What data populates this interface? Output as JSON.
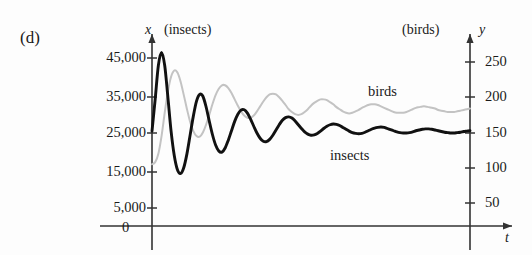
{
  "panel": {
    "label": "(d)"
  },
  "axes": {
    "left": {
      "variable": "x",
      "unit_label": "(insects)",
      "ticks": [
        {
          "label": "45,000",
          "value": 45000,
          "py": 58
        },
        {
          "label": "35,000",
          "value": 35000,
          "py": 97
        },
        {
          "label": "25,000",
          "value": 25000,
          "py": 133
        },
        {
          "label": "15,000",
          "value": 15000,
          "py": 172
        },
        {
          "label": "5,000",
          "value": 5000,
          "py": 208
        }
      ]
    },
    "right": {
      "variable": "y",
      "unit_label": "(birds)",
      "ticks": [
        {
          "label": "250",
          "value": 250,
          "py": 62
        },
        {
          "label": "200",
          "value": 200,
          "py": 97
        },
        {
          "label": "150",
          "value": 150,
          "py": 133
        },
        {
          "label": "100",
          "value": 100,
          "py": 168
        },
        {
          "label": "50",
          "value": 50,
          "py": 203
        }
      ]
    },
    "bottom": {
      "variable": "t",
      "origin_label": "0"
    }
  },
  "series_labels": {
    "birds": "birds",
    "insects": "insects"
  },
  "colors": {
    "insects": "#111111",
    "birds": "#c3c3c3",
    "axis": "#333333",
    "text": "#1a1a1a",
    "background": "#fdfdfd"
  },
  "chart_data": {
    "type": "line",
    "title": "",
    "xlabel": "t",
    "ylabel": "x (insects)",
    "y2label": "y (birds)",
    "grid": false,
    "legend": "inline-annotation",
    "ylim": [
      0,
      50000
    ],
    "y2lim": [
      0,
      277
    ],
    "xlim": [
      0,
      100
    ],
    "series": [
      {
        "name": "insects",
        "color": "#111111",
        "axis": "left",
        "units": "insects",
        "equilibrium": 25000,
        "x": [
          0,
          1,
          2,
          3,
          4,
          5,
          6,
          7,
          8,
          9,
          10,
          11,
          12,
          13,
          14,
          15,
          16,
          17,
          18,
          19,
          20,
          21,
          22,
          23,
          24,
          25,
          26,
          27,
          28,
          29,
          30,
          31,
          32,
          33,
          34,
          35,
          36,
          37,
          38,
          39,
          40,
          41,
          42,
          43,
          44,
          45,
          46,
          47,
          48,
          49,
          50,
          51,
          52,
          53,
          54,
          55,
          56,
          57,
          58,
          59,
          60,
          61,
          62,
          63,
          64,
          65,
          66,
          67,
          68,
          69,
          70,
          71,
          72,
          73,
          74,
          75,
          76,
          77,
          78,
          79,
          80,
          81,
          82,
          83,
          84,
          85,
          86,
          87,
          88,
          89,
          90,
          91,
          92,
          93,
          94,
          95,
          96,
          97,
          98,
          99,
          100
        ],
        "values": [
          25500,
          34000,
          43000,
          46500,
          43000,
          34500,
          25500,
          19000,
          15200,
          14200,
          15800,
          19500,
          24500,
          29500,
          33500,
          35300,
          34800,
          32000,
          28200,
          24600,
          21800,
          20200,
          19900,
          21000,
          23100,
          25600,
          28100,
          30000,
          31100,
          31200,
          30300,
          28700,
          26800,
          25000,
          23600,
          22800,
          22700,
          23300,
          24400,
          25800,
          27200,
          28400,
          29100,
          29300,
          29000,
          28200,
          27200,
          26200,
          25300,
          24700,
          24400,
          24500,
          24900,
          25500,
          26200,
          26800,
          27200,
          27400,
          27300,
          27000,
          26500,
          26000,
          25500,
          25100,
          24900,
          24800,
          24900,
          25200,
          25600,
          26000,
          26300,
          26500,
          26600,
          26500,
          26200,
          25900,
          25600,
          25300,
          25100,
          25000,
          25000,
          25100,
          25300,
          25600,
          25800,
          26000,
          26100,
          26100,
          26000,
          25800,
          25600,
          25400,
          25200,
          25100,
          25000,
          25000,
          25100,
          25200,
          25400,
          25500,
          25600
        ]
      },
      {
        "name": "birds",
        "color": "#c3c3c3",
        "axis": "right",
        "units": "birds",
        "equilibrium": 180,
        "x": [
          0,
          1,
          2,
          3,
          4,
          5,
          6,
          7,
          8,
          9,
          10,
          11,
          12,
          13,
          14,
          15,
          16,
          17,
          18,
          19,
          20,
          21,
          22,
          23,
          24,
          25,
          26,
          27,
          28,
          29,
          30,
          31,
          32,
          33,
          34,
          35,
          36,
          37,
          38,
          39,
          40,
          41,
          42,
          43,
          44,
          45,
          46,
          47,
          48,
          49,
          50,
          51,
          52,
          53,
          54,
          55,
          56,
          57,
          58,
          59,
          60,
          61,
          62,
          63,
          64,
          65,
          66,
          67,
          68,
          69,
          70,
          71,
          72,
          73,
          74,
          75,
          76,
          77,
          78,
          79,
          80,
          81,
          82,
          83,
          84,
          85,
          86,
          87,
          88,
          89,
          90,
          91,
          92,
          93,
          94,
          95,
          96,
          97,
          98,
          99,
          100
        ],
        "values": [
          105,
          108,
          120,
          145,
          178,
          208,
          229,
          238,
          235,
          222,
          203,
          183,
          165,
          152,
          145,
          144,
          150,
          161,
          175,
          190,
          203,
          212,
          217,
          217,
          213,
          206,
          197,
          188,
          180,
          174,
          171,
          171,
          174,
          180,
          187,
          194,
          200,
          204,
          205,
          204,
          200,
          195,
          189,
          183,
          179,
          176,
          175,
          176,
          179,
          183,
          188,
          192,
          195,
          197,
          197,
          196,
          193,
          190,
          186,
          183,
          180,
          178,
          177,
          178,
          180,
          182,
          185,
          187,
          189,
          190,
          190,
          189,
          187,
          185,
          183,
          181,
          179,
          178,
          178,
          178,
          179,
          181,
          183,
          185,
          186,
          187,
          187,
          186,
          185,
          184,
          182,
          181,
          180,
          179,
          179,
          179,
          180,
          181,
          182,
          183,
          184
        ]
      }
    ]
  }
}
